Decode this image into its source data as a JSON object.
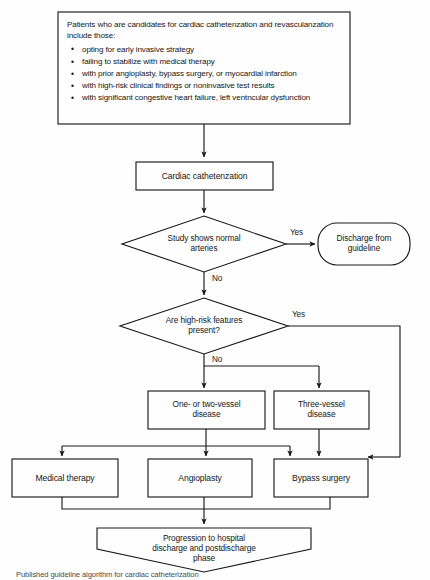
{
  "diagram": {
    "criteria": {
      "intro": "Patients who are candidates for cardiac cathetenzation and revasculanzation include those:",
      "items": [
        "opting for early invasive strategy",
        "failing to stabilize with medical therapy",
        "with prior angioplasty, bypass surgery, or myocardial infarction",
        "with high-risk clinical findings or noninvasive test results",
        "with significant congestive heart failure, left ventncular dysfunction"
      ],
      "bullet_glyph": "•"
    },
    "nodes": {
      "catheterization": "Cardiac cathetenzation",
      "decision_normal": "Study shows normal\narteries",
      "discharge": "Discharge from\nguideline",
      "decision_highrisk": "Are high-risk features\npresent?",
      "one_two_vessel": "One- or two-vessel\ndisease",
      "three_vessel": "Three-vessel\ndisease",
      "medical_therapy": "Medical therapy",
      "angioplasty": "Angioplasty",
      "bypass_surgery": "Bypass surgery",
      "progression": "Progression to hospital\ndischarge and postdischarge\nphase"
    },
    "edge_labels": {
      "normal_yes": "Yes",
      "normal_no": "No",
      "highrisk_yes": "Yes",
      "highrisk_no": "No"
    },
    "colors": {
      "stroke": "#1a1a1a",
      "text": "#161616",
      "background": "#fefefe"
    },
    "caption": "Published guideline algorithm for cardiac catheterization"
  }
}
